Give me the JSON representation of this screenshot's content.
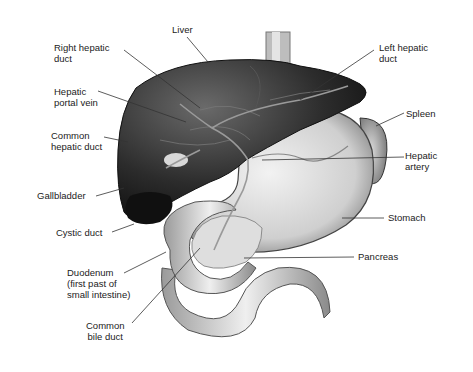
{
  "labels": {
    "liver": "Liver",
    "right_hepatic_duct": "Right hepatic\nduct",
    "left_hepatic_duct": "Left hepatic\nduct",
    "hepatic_portal_vein": "Hepatic\nportal vein",
    "spleen": "Spleen",
    "common_hepatic_duct": "Common\nhepatic duct",
    "hepatic_artery": "Hepatic\nartery",
    "gallbladder": "Gallbladder",
    "stomach": "Stomach",
    "cystic_duct": "Cystic duct",
    "pancreas": "Pancreas",
    "duodenum": "Duodenum\n(first past of\nsmall intestine)",
    "common_bile_duct": "Common\nbile duct"
  }
}
